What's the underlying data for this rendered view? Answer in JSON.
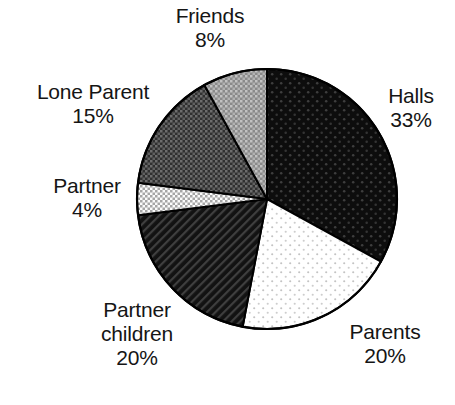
{
  "chart_data": {
    "type": "pie",
    "title": "",
    "subtitle": "",
    "xlabel": "",
    "ylabel": "",
    "legend_position": "none",
    "grid": false,
    "labels_outside": true,
    "start_angle_deg": 0,
    "direction": "clockwise",
    "categories": [
      "Halls",
      "Parents",
      "Partner children",
      "Partner",
      "Lone Parent",
      "Friends"
    ],
    "values": [
      33,
      20,
      20,
      4,
      15,
      8
    ],
    "unit": "%",
    "total": 100,
    "slices": [
      {
        "name": "Halls",
        "value": 33,
        "value_text": "33%",
        "label_text": "Halls",
        "fill_name": "dark-sparse-dots",
        "fill_color": "#0d0d0d",
        "pattern_color": "#3a3a3a"
      },
      {
        "name": "Parents",
        "value": 20,
        "value_text": "20%",
        "label_text": "Parents",
        "fill_name": "white-sparse-dots",
        "fill_color": "#ffffff",
        "pattern_color": "#b9b9b9"
      },
      {
        "name": "Partner children",
        "value": 20,
        "value_text": "20%",
        "label_text": "Partner children",
        "label_line1": "Partner",
        "label_line2": "children",
        "fill_name": "dark-diagonal-hatch",
        "fill_color": "#131313",
        "pattern_color": "#4a4a4a"
      },
      {
        "name": "Partner",
        "value": 4,
        "value_text": "4%",
        "label_text": "Partner",
        "fill_name": "light-checker",
        "fill_color": "#f2f2f2",
        "pattern_color": "#9c9c9c"
      },
      {
        "name": "Lone Parent",
        "value": 15,
        "value_text": "15%",
        "label_text": "Lone Parent",
        "fill_name": "mid-dark-crosshatch",
        "fill_color": "#3b3b3b",
        "pattern_color": "#6f6f6f"
      },
      {
        "name": "Friends",
        "value": 8,
        "value_text": "8%",
        "label_text": "Friends",
        "fill_name": "mid-gray-crosshatch",
        "fill_color": "#8e8e8e",
        "pattern_color": "#bdbdbd"
      }
    ],
    "outline_color": "#000000",
    "background_color": "#ffffff"
  },
  "labels": {
    "friends": {
      "name": "Friends",
      "value": "8%"
    },
    "lone_parent": {
      "name": "Lone Parent",
      "value": "15%"
    },
    "partner": {
      "name": "Partner",
      "value": "4%"
    },
    "partner_child": {
      "line1": "Partner",
      "line2": "children",
      "value": "20%"
    },
    "parents": {
      "name": "Parents",
      "value": "20%"
    },
    "halls": {
      "name": "Halls",
      "value": "33%"
    }
  }
}
